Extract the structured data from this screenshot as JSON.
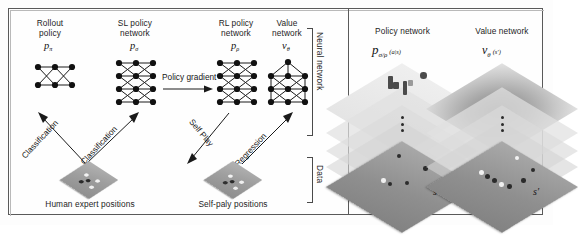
{
  "figure": {
    "background_color": "#ffffff",
    "frame_color": "#5a5a5a"
  },
  "left_panel": {
    "networks": [
      {
        "id": "rollout-policy",
        "label_line1": "Rollout",
        "label_line2": "policy",
        "symbol": "p",
        "subscript": "π",
        "layers": [
          3,
          3
        ],
        "node_count": 6
      },
      {
        "id": "sl-policy-network",
        "label_line1": "SL policy",
        "label_line2": "network",
        "symbol": "p",
        "subscript": "σ",
        "layers": [
          3,
          3,
          3,
          3
        ],
        "node_count": 12
      },
      {
        "id": "rl-policy-network",
        "label_line1": "RL policy",
        "label_line2": "network",
        "symbol": "p",
        "subscript": "ρ",
        "layers": [
          3,
          3,
          3,
          3
        ],
        "node_count": 12
      },
      {
        "id": "value-network",
        "label_line1": "Value",
        "label_line2": "network",
        "symbol": "v",
        "subscript": "θ",
        "layers": [
          1,
          3,
          3,
          3
        ],
        "node_count": 10
      }
    ],
    "arrows": [
      {
        "id": "classification-left",
        "label": "Classification",
        "rotation_deg": -62
      },
      {
        "id": "classification-right",
        "label": "Classification",
        "rotation_deg": -62
      },
      {
        "id": "policy-gradient",
        "label": "Policy gradient",
        "rotation_deg": 0
      },
      {
        "id": "self-play",
        "label": "Self Play",
        "rotation_deg": 62
      },
      {
        "id": "regression",
        "label": "Regression",
        "rotation_deg": -62
      }
    ],
    "data_sources": [
      {
        "id": "human-expert-positions",
        "label": "Human expert positions"
      },
      {
        "id": "self-play-positions",
        "label": "Self-paly positions"
      }
    ],
    "brackets": [
      {
        "id": "neural-network-bracket",
        "label": "Neural network"
      },
      {
        "id": "data-bracket",
        "label": "Data"
      }
    ]
  },
  "right_panel": {
    "columns": [
      {
        "id": "policy-network-architecture",
        "title": "Policy network",
        "symbol": "p",
        "subscript": "σ/ρ",
        "argument": "(a|s)",
        "input_label": "s",
        "plane_count": 5
      },
      {
        "id": "value-network-architecture",
        "title": "Value network",
        "symbol": "v",
        "subscript": "θ",
        "argument": "(s′)",
        "input_label": "s′",
        "plane_count": 5
      }
    ]
  }
}
